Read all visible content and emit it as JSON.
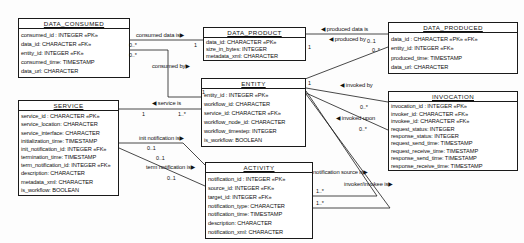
{
  "diagram": {
    "colors": {
      "background": "#fdfdfd",
      "line": "#1a1a1a",
      "box_fill": "#ffffff",
      "text": "#111111"
    },
    "entities": [
      {
        "id": "data_consumed",
        "title": "DATA_CONSUMED",
        "x": 18,
        "y": 18,
        "w": 112,
        "h": 60,
        "attributes": [
          "consumed_id : INTEGER   «PK»",
          "data_id: CHARACTER   «FK»",
          "entity_id: INTEGER   «FK»",
          "consumed_time: TIMESTAMP",
          "data_url: CHARACTER"
        ]
      },
      {
        "id": "data_product",
        "title": "DATA_PRODUCT",
        "x": 203,
        "y": 27,
        "w": 103,
        "h": 34,
        "attributes": [
          "data_id: CHARACTER   «PK»",
          "size_in_bytes: INTEGER",
          "metadata_xml: CHARACTER"
        ]
      },
      {
        "id": "data_produced",
        "title": "DATA_PRODUCED",
        "x": 388,
        "y": 22,
        "w": 130,
        "h": 52,
        "attributes": [
          "data_id : CHARACTER   «PK» «FK»",
          "entity_id: INTEGER   «FK»",
          "produced_time: TIMESTAMP",
          "data_url: CHARACTER"
        ]
      },
      {
        "id": "entity",
        "title": "ENTITY",
        "x": 201,
        "y": 78,
        "w": 105,
        "h": 69,
        "attributes": [
          "entity_id : INTEGER   «PK»",
          "workflow_id: CHARACTER",
          "service_id: CHARACTER   «FK»",
          "workflow_node_id: CHARACTER",
          "workflow_timestep: INTEGER",
          "is_workflow: BOOLEAN"
        ]
      },
      {
        "id": "service",
        "title": "SERVICE",
        "x": 18,
        "y": 100,
        "w": 101,
        "h": 96,
        "attributes": [
          "service_id : CHARACTER   «PK»",
          "service_location: CHARACTER",
          "service_interface: CHARACTER",
          "initialization_time: TIMESTAMP",
          "init_notification_id: INTEGER  «FK»",
          "termination_time: TIMESTAMP",
          "term_notification_id: INTEGER  «FK»",
          "description: CHARACTER",
          "metadata_xml: CHARACTER",
          "is_workflow: BOOLEAN"
        ]
      },
      {
        "id": "invocation",
        "title": "INVOCATION",
        "x": 388,
        "y": 91,
        "w": 130,
        "h": 80,
        "attributes": [
          "invocation_id : INTEGER   «PK»",
          "invoker_id: CHARACTER   «FK»",
          "invokee_id: CHARACTER   «FK»",
          "request_status: INTEGER",
          "response_status: INTEGER",
          "request_send_time: TIMESTAMP",
          "request_receive_time: TIMESTAMP",
          "response_send_time: TIMESTAMP",
          "response_receive_time: TIMESTAMP"
        ]
      },
      {
        "id": "activity",
        "title": "ACTIVITY",
        "x": 205,
        "y": 162,
        "w": 108,
        "h": 77,
        "attributes": [
          "notification_id : INTEGER   «PK»",
          "source_id: INTEGER   «FK»",
          "target_id: INTEGER   «FK»",
          "notification_type: CHARACTER",
          "notification_time: TIMESTAMP",
          "description: CHARACTER",
          "notification_xml: CHARACTER"
        ]
      }
    ],
    "connectors": [
      {
        "name": "consumed-data-is",
        "from": "data_consumed",
        "to": "data_product",
        "points": "130,40 203,40"
      },
      {
        "name": "consumed-by",
        "from": "data_consumed",
        "to": "entity",
        "points": "130,50 168,50 168,97 201,97"
      },
      {
        "name": "produced-data-is",
        "from": "data_product",
        "to": "data_produced",
        "points": "306,34 388,34"
      },
      {
        "name": "produced-by",
        "from": "entity",
        "to": "data_produced",
        "points": "305,79 388,47"
      },
      {
        "name": "invoked-by",
        "from": "entity",
        "to": "invocation",
        "points": "306,88 388,102"
      },
      {
        "name": "invoked-upon",
        "from": "entity",
        "to": "invocation",
        "points": "306,93 388,130"
      },
      {
        "name": "service-is",
        "from": "service",
        "to": "entity",
        "points": "119,109 201,109"
      },
      {
        "name": "init-notification-is",
        "from": "service",
        "to": "activity",
        "points": "119,143 183,143 205,165"
      },
      {
        "name": "term-notification-is",
        "from": "service",
        "to": "activity",
        "points": "119,148 205,186"
      },
      {
        "name": "notification-source-is",
        "from": "entity",
        "to": "activity",
        "points": "306,91 377,196 313,196"
      },
      {
        "name": "invoker-invokee-is",
        "from": "entity",
        "to": "activity",
        "points": "306,94 390,208 313,208"
      }
    ],
    "labels": [
      {
        "kind": "rel",
        "text": "consumed data is▶",
        "x": 136,
        "y": 32
      },
      {
        "kind": "mult",
        "text": "0..*",
        "x": 129,
        "y": 42
      },
      {
        "kind": "mult",
        "text": "0..*",
        "x": 129,
        "y": 52
      },
      {
        "kind": "mult",
        "text": "1",
        "x": 194,
        "y": 42
      },
      {
        "kind": "rel",
        "text": "consumed by▶",
        "x": 152,
        "y": 63
      },
      {
        "kind": "mult",
        "text": "1",
        "x": 202,
        "y": 89
      },
      {
        "kind": "rel",
        "text": "◀ produced data is",
        "x": 321,
        "y": 26
      },
      {
        "kind": "mult",
        "text": "1",
        "x": 308,
        "y": 44
      },
      {
        "kind": "rel",
        "text": "◀ produced by",
        "x": 329,
        "y": 36
      },
      {
        "kind": "mult",
        "text": "0..1",
        "x": 367,
        "y": 38
      },
      {
        "kind": "mult",
        "text": "0..*",
        "x": 372,
        "y": 47
      },
      {
        "kind": "mult",
        "text": "1",
        "x": 308,
        "y": 80
      },
      {
        "kind": "rel",
        "text": "◀ invoked by",
        "x": 340,
        "y": 82
      },
      {
        "kind": "mult",
        "text": "0..*",
        "x": 360,
        "y": 104
      },
      {
        "kind": "rel",
        "text": "◀ invoked upon",
        "x": 336,
        "y": 115
      },
      {
        "kind": "mult",
        "text": "0..*",
        "x": 359,
        "y": 126
      },
      {
        "kind": "rel",
        "text": "◀ service is",
        "x": 152,
        "y": 100
      },
      {
        "kind": "mult",
        "text": "1",
        "x": 142,
        "y": 111
      },
      {
        "kind": "mult",
        "text": "1..*",
        "x": 178,
        "y": 111
      },
      {
        "kind": "rel",
        "text": "init notification is▶",
        "x": 139,
        "y": 135
      },
      {
        "kind": "mult",
        "text": "0..1",
        "x": 147,
        "y": 145
      },
      {
        "kind": "mult",
        "text": "0..1",
        "x": 156,
        "y": 155
      },
      {
        "kind": "rel",
        "text": "term notification is▶",
        "x": 146,
        "y": 164
      },
      {
        "kind": "mult",
        "text": "0..1",
        "x": 167,
        "y": 175
      },
      {
        "kind": "rel",
        "text": "notification source is▶",
        "x": 313,
        "y": 169
      },
      {
        "kind": "rel",
        "text": "invoker/invokee is▶",
        "x": 344,
        "y": 181
      },
      {
        "kind": "mult",
        "text": "1..*",
        "x": 316,
        "y": 188
      },
      {
        "kind": "mult",
        "text": "1..*",
        "x": 316,
        "y": 200
      }
    ]
  }
}
